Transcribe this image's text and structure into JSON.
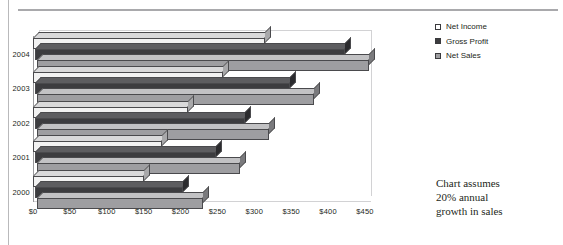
{
  "chart_data": {
    "type": "bar",
    "orientation": "horizontal",
    "style": "3d-grouped",
    "title": "",
    "xlabel": "",
    "ylabel": "",
    "categories": [
      "2000",
      "2001",
      "2002",
      "2003",
      "2004"
    ],
    "series": [
      {
        "name": "Net Sales",
        "values": [
          225,
          275,
          315,
          375,
          450
        ],
        "color": "#9e9ea1"
      },
      {
        "name": "Gross Profit",
        "values": [
          200,
          245,
          285,
          345,
          420
        ],
        "color": "#3c3c3f"
      },
      {
        "name": "Net Income",
        "values": [
          150,
          175,
          210,
          258,
          315
        ],
        "color": "#f2f2f2"
      }
    ],
    "xlim": [
      0,
      450
    ],
    "xticks": [
      0,
      50,
      100,
      150,
      200,
      250,
      300,
      350,
      400,
      450
    ],
    "xticklabels": [
      "$0",
      "$50",
      "$100",
      "$150",
      "$200",
      "$250",
      "$300",
      "$350",
      "$400",
      "$450"
    ],
    "grid": false,
    "legend_position": "right-top",
    "annotations": [
      "Chart assumes",
      "20% annual",
      "growth in sales"
    ]
  },
  "legend": {
    "items": [
      {
        "label": "Net Income",
        "swatch": "net-income"
      },
      {
        "label": "Gross Profit",
        "swatch": "gross-profit"
      },
      {
        "label": "Net Sales",
        "swatch": "net-sales"
      }
    ]
  },
  "note": {
    "line1": "Chart assumes",
    "line2": "20% annual",
    "line3": "growth in sales"
  }
}
